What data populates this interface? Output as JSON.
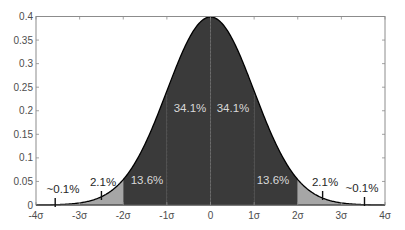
{
  "chart_data": {
    "type": "area",
    "title": "",
    "xlabel": "",
    "ylabel": "",
    "distribution": "standard normal probability density",
    "xlim": [
      -4,
      4
    ],
    "ylim": [
      0,
      0.4
    ],
    "grid": false,
    "legend": null,
    "x_ticks": [
      -4,
      -3,
      -2,
      -1,
      0,
      1,
      2,
      3,
      4
    ],
    "x_tick_labels": [
      "-4σ",
      "-3σ",
      "-2σ",
      "-1σ",
      "0",
      "1σ",
      "2σ",
      "3σ",
      "4σ"
    ],
    "y_ticks": [
      0,
      0.05,
      0.1,
      0.15,
      0.2,
      0.25,
      0.3,
      0.35,
      0.4
    ],
    "y_tick_labels": [
      "0",
      "0.05",
      "0.1",
      "0.15",
      "0.2",
      "0.25",
      "0.3",
      "0.35",
      "0.4"
    ],
    "curve": {
      "x": [
        -4,
        -3.5,
        -3,
        -2.5,
        -2,
        -1.5,
        -1,
        -0.5,
        0,
        0.5,
        1,
        1.5,
        2,
        2.5,
        3,
        3.5,
        4
      ],
      "y": [
        0.0001,
        0.0009,
        0.0044,
        0.0175,
        0.054,
        0.1295,
        0.242,
        0.3521,
        0.3989,
        0.3521,
        0.242,
        0.1295,
        0.054,
        0.0175,
        0.0044,
        0.0009,
        0.0001
      ]
    },
    "regions": [
      {
        "from": -4,
        "to": -3,
        "percent": "~0.1%",
        "fill": "#ffffff"
      },
      {
        "from": -3,
        "to": -2,
        "percent": "2.1%",
        "fill": "#a6a6a6"
      },
      {
        "from": -2,
        "to": -1,
        "percent": "13.6%",
        "fill": "#3a3a3a"
      },
      {
        "from": -1,
        "to": 0,
        "percent": "34.1%",
        "fill": "#3a3a3a"
      },
      {
        "from": 0,
        "to": 1,
        "percent": "34.1%",
        "fill": "#3a3a3a"
      },
      {
        "from": 1,
        "to": 2,
        "percent": "13.6%",
        "fill": "#3a3a3a"
      },
      {
        "from": 2,
        "to": 3,
        "percent": "2.1%",
        "fill": "#a6a6a6"
      },
      {
        "from": 3,
        "to": 4,
        "percent": "~0.1%",
        "fill": "#ffffff"
      }
    ],
    "annotations": [
      {
        "text": "~0.1%",
        "x": -3.5,
        "tick_x": -3.56,
        "style": "light",
        "lx": 63,
        "ly": 193
      },
      {
        "text": "2.1%",
        "x": -2.5,
        "tick_x": -2.5,
        "style": "light",
        "lx": 103,
        "ly": 186
      },
      {
        "text": "13.6%",
        "x": -1.5,
        "style": "dark",
        "lx": 147,
        "ly": 184
      },
      {
        "text": "34.1%",
        "x": -0.5,
        "style": "dark",
        "lx": 190,
        "ly": 112
      },
      {
        "text": "34.1%",
        "x": 0.5,
        "style": "dark",
        "lx": 233,
        "ly": 112
      },
      {
        "text": "13.6%",
        "x": 1.5,
        "style": "dark",
        "lx": 273,
        "ly": 184
      },
      {
        "text": "2.1%",
        "x": 2.5,
        "tick_x": 2.57,
        "style": "light",
        "lx": 325,
        "ly": 186
      },
      {
        "text": "~0.1%",
        "x": 3.5,
        "tick_x": 3.53,
        "style": "light",
        "lx": 362,
        "ly": 192
      }
    ],
    "colors": {
      "dark_fill": "#3a3a3a",
      "light_fill": "#a6a6a6",
      "axis": "#8c8c8c",
      "curve": "#000000",
      "dark_label": "#d9d9d9",
      "light_label": "#262626",
      "divider": "#555555"
    }
  }
}
